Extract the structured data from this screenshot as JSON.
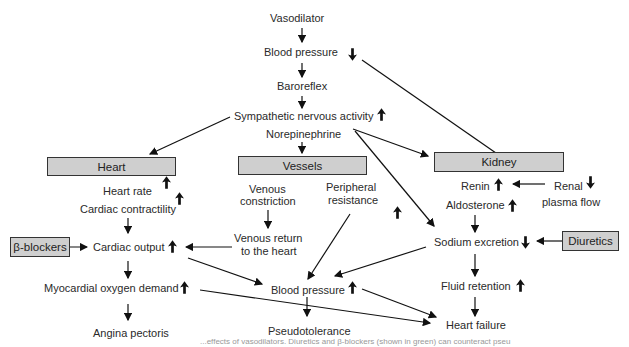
{
  "diagram": {
    "nodes": {
      "vasodilator": "Vasodilator",
      "blood_pressure_top": "Blood pressure",
      "baroreflex": "Baroreflex",
      "sympathetic": "Sympathetic nervous activity",
      "norepinephrine": "Norepinephrine",
      "heart_box": "Heart",
      "vessels_box": "Vessels",
      "kidney_box": "Kidney",
      "heart_rate": "Heart rate",
      "cardiac_contractility": "Cardiac contractility",
      "beta_blockers": "β-blockers",
      "cardiac_output": "Cardiac output",
      "myocardial_oxygen": "Myocardial oxygen demand",
      "angina": "Angina pectoris",
      "venous_constriction_1": "Venous",
      "venous_constriction_2": "constriction",
      "peripheral_1": "Peripheral",
      "peripheral_2": "resistance",
      "venous_return_1": "Venous return",
      "venous_return_2": "to the heart",
      "blood_pressure_mid": "Blood pressure",
      "pseudotolerance": "Pseudotolerance",
      "renin": "Renin",
      "renal_1": "Renal",
      "renal_2": "plasma flow",
      "aldosterone": "Aldosterone",
      "sodium_excretion": "Sodium excretion",
      "diuretics": "Diuretics",
      "fluid_retention": "Fluid retention",
      "heart_failure": "Heart failure"
    },
    "indicators": {
      "blood_pressure_top": "down",
      "sympathetic": "up",
      "heart_rate": "up",
      "cardiac_contractility": "up",
      "cardiac_output": "up",
      "myocardial_oxygen": "up",
      "peripheral_resistance": "up",
      "blood_pressure_mid": "up",
      "renin": "up",
      "renal_plasma_flow": "down",
      "aldosterone": "up",
      "sodium_excretion": "down",
      "fluid_retention": "up"
    },
    "caption": "...effects of vasodilators. Diuretics and β-blockers (shown in green) can counteract pseu"
  }
}
